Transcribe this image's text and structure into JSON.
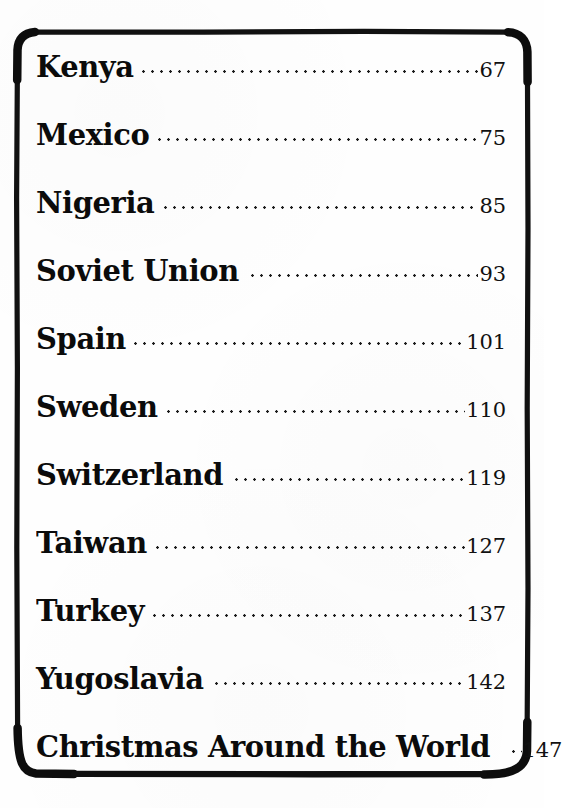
{
  "document": {
    "kind": "table-of-contents",
    "background_color": "#fefefe",
    "ink_color": "#0b0b0b",
    "border_color": "#111111"
  },
  "contents": {
    "entries": [
      {
        "title": "Kenya",
        "page": "67"
      },
      {
        "title": "Mexico",
        "page": "75"
      },
      {
        "title": "Nigeria",
        "page": "85"
      },
      {
        "title": "Soviet Union",
        "page": "93"
      },
      {
        "title": "Spain",
        "page": "101"
      },
      {
        "title": "Sweden",
        "page": "110"
      },
      {
        "title": "Switzerland",
        "page": "119"
      },
      {
        "title": "Taiwan",
        "page": "127"
      },
      {
        "title": "Turkey",
        "page": "137"
      },
      {
        "title": "Yugoslavia",
        "page": "142"
      },
      {
        "title": "Christmas Around the World",
        "page": "147"
      }
    ]
  }
}
